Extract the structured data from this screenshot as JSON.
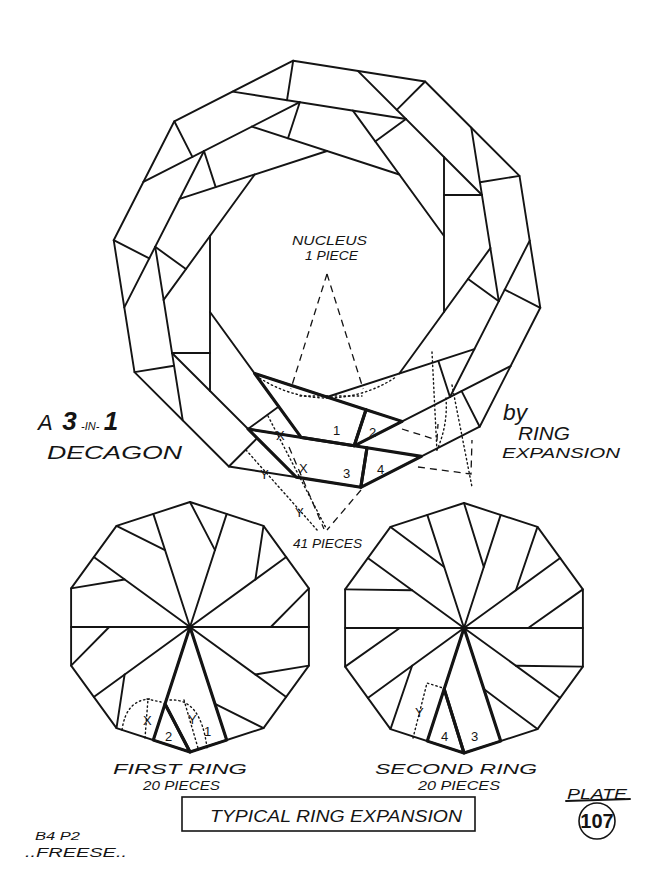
{
  "plate": {
    "nucleus": {
      "line1": "NUCLEUS",
      "line2": "1 PIECE"
    },
    "title_left": {
      "a": "A",
      "three": "3",
      "in": "-IN-",
      "one": "1",
      "line2": "DECAGON"
    },
    "title_right": {
      "by": "by",
      "ring": "RING",
      "expansion": "EXPANSION"
    },
    "total_pieces": "41 PIECES",
    "main_piece_numbers": [
      "1",
      "2",
      "3",
      "4"
    ],
    "main_markers": [
      "X",
      "X",
      "Y",
      "Y"
    ],
    "first_ring": {
      "label": "FIRST RING",
      "pieces": "20 PIECES",
      "piece_numbers": [
        "1",
        "2"
      ],
      "markers": [
        "X",
        "Y"
      ]
    },
    "second_ring": {
      "label": "SECOND RING",
      "pieces": "20 PIECES",
      "piece_numbers": [
        "4",
        "3"
      ],
      "markers": [
        "Y"
      ]
    },
    "caption": "TYPICAL RING EXPANSION",
    "plate_label": "PLATE",
    "plate_number": "107",
    "credit": {
      "line1": "B4 P2",
      "line2": "..FREESE.."
    }
  },
  "diagram": {
    "ink": "#141414",
    "paper": "#ffffff",
    "main": {
      "cx": 327,
      "cy": 274,
      "r": 216,
      "rotation_deg": -99,
      "outer_band_width": 40,
      "inner_band_width": 38,
      "inner_band_twist_deg": 9,
      "highlight_strip": 5
    },
    "small_decagons": [
      {
        "name": "first-ring-decagon",
        "cx": 190,
        "cy": 627,
        "r": 125,
        "rotation_deg": -90,
        "cut_ratio": 0.68,
        "highlight_vertex": 5
      },
      {
        "name": "second-ring-decagon",
        "cx": 464,
        "cy": 628,
        "r": 125,
        "rotation_deg": -90,
        "cut_ratio": 0.54,
        "highlight_vertex": 5
      }
    ],
    "guides": [
      {
        "style": "dashed",
        "points": [
          [
            327,
            274
          ],
          [
            290.8,
            389
          ]
        ]
      },
      {
        "style": "dashed",
        "points": [
          [
            327,
            274
          ],
          [
            363.2,
            389
          ]
        ]
      },
      {
        "style": "dotted",
        "arc": {
          "cx": 327,
          "cy": 274,
          "r": 124,
          "start": 57,
          "end": 123
        }
      },
      {
        "style": "dotted",
        "points": [
          [
            300,
            396
          ],
          [
            362,
            396
          ]
        ]
      },
      {
        "style": "dotted",
        "points": [
          [
            268,
            416
          ],
          [
            326,
            528
          ]
        ]
      },
      {
        "style": "dotted",
        "points": [
          [
            246,
            450
          ],
          [
            318,
            531
          ]
        ]
      },
      {
        "style": "dashed",
        "points": [
          [
            289,
            447
          ],
          [
            324,
            529
          ]
        ]
      },
      {
        "style": "dashed",
        "points": [
          [
            361,
            490
          ],
          [
            327,
            530
          ]
        ]
      },
      {
        "style": "dashed",
        "points": [
          [
            402,
            429
          ],
          [
            437,
            440
          ],
          [
            438,
            424
          ]
        ]
      },
      {
        "style": "dotted",
        "points": [
          [
            432,
            352
          ],
          [
            437,
            452
          ]
        ]
      },
      {
        "style": "dotted",
        "points": [
          [
            452,
            385
          ],
          [
            472,
            487
          ]
        ]
      },
      {
        "style": "dashed",
        "points": [
          [
            418,
            467
          ],
          [
            471,
            474
          ],
          [
            472,
            440
          ]
        ]
      },
      {
        "style": "dotted",
        "path": "M446,398 Q448,425 437,450"
      },
      {
        "style": "dotted",
        "path": "M122,730 Q126,700 150,699"
      },
      {
        "style": "dotted",
        "points": [
          [
            147,
            699
          ],
          [
            161,
            702
          ]
        ]
      },
      {
        "style": "dotted",
        "points": [
          [
            145,
            738
          ],
          [
            148,
            699
          ]
        ]
      },
      {
        "style": "dotted",
        "path": "M170,700 Q201,698 207,748"
      },
      {
        "style": "dotted",
        "points": [
          [
            184,
            700
          ],
          [
            198,
            748
          ]
        ]
      },
      {
        "style": "dotted",
        "points": [
          [
            413,
            738
          ],
          [
            427,
            683
          ],
          [
            443,
            688
          ]
        ]
      }
    ]
  }
}
